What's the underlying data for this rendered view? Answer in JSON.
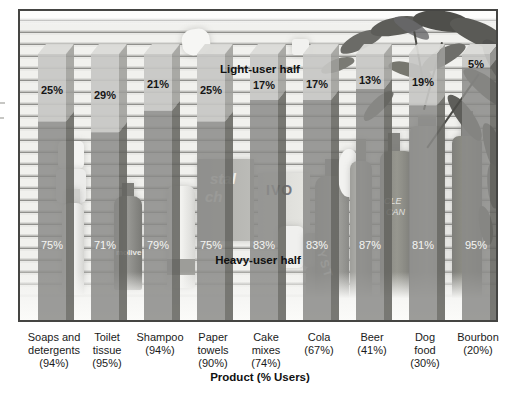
{
  "figure": {
    "xlabel": "Product (% Users)",
    "annotation_light": "Light-user half",
    "annotation_heavy": "Heavy-user half"
  },
  "chart_data": {
    "type": "bar",
    "subtype": "3d-stacked-percentage-columns-over-photo",
    "title": "",
    "xlabel": "Product (% Users)",
    "ylabel": "",
    "ylim": [
      0,
      100
    ],
    "grid": false,
    "legend_position": "inline-annotations",
    "annotations": [
      "Light-user half",
      "Heavy-user half"
    ],
    "categories": [
      "Soaps and detergents (94%)",
      "Toilet tissue (95%)",
      "Shampoo (94%)",
      "Paper towels (90%)",
      "Cake mixes (74%)",
      "Cola (67%)",
      "Beer (41%)",
      "Dog food (30%)",
      "Bourbon (20%)"
    ],
    "category_label_lines": [
      [
        "Soaps and",
        "detergents",
        "(94%)"
      ],
      [
        "Toilet",
        "tissue",
        "(95%)"
      ],
      [
        "Shampoo",
        "(94%)"
      ],
      [
        "Paper",
        "towels",
        "(90%)"
      ],
      [
        "Cake",
        "mixes",
        "(74%)"
      ],
      [
        "Cola",
        "(67%)"
      ],
      [
        "Beer",
        "(41%)"
      ],
      [
        "Dog",
        "food",
        "(30%)"
      ],
      [
        "Bourbon",
        "(20%)"
      ]
    ],
    "series": [
      {
        "name": "Light-user half",
        "values": [
          25,
          29,
          21,
          25,
          17,
          17,
          13,
          19,
          5
        ]
      },
      {
        "name": "Heavy-user half",
        "values": [
          75,
          71,
          79,
          75,
          83,
          83,
          87,
          81,
          95
        ]
      }
    ],
    "value_label_format": "{value}%"
  },
  "background_photo": {
    "description": "grayscale photo of store shelf products with houseplant",
    "visible_product_texts": [
      "molive",
      "stal",
      "ch",
      "IVO",
      "CLE",
      "CAN",
      "RYST"
    ]
  },
  "colors": {
    "light_front": "#c7c7c4",
    "light_top": "#dadad7",
    "light_side": "#9e9e9b",
    "heavy_front": "#8b8b88",
    "heavy_side": "#656561",
    "label_dark": "#161616",
    "label_white": "#f5f5f3",
    "frame_border": "#454543"
  }
}
